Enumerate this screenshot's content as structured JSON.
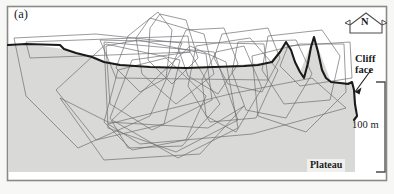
{
  "figure": {
    "panel_letter": "(a)",
    "type": "terrain-cross-section-with-home-range-polygons",
    "annotations": {
      "cliff_face": "Cliff\nface",
      "plateau": "Plateau",
      "scale": "100 m",
      "north": "N"
    },
    "colors": {
      "background": "#f7f7f5",
      "frame": "#8a8a88",
      "terrain_fill": "#d9d9d7",
      "terrain_profile_line": "#1a1a1a",
      "polygon_line": "#6e6e72",
      "label_text": "#1b1b1b",
      "plateau_badge": "#f0f0ee"
    },
    "elements": {
      "frame_visible": true,
      "north_arrow_shape": "pentagon-with-side-points",
      "scale_bar_style": "vertical-bracket-right",
      "cliff_leader_arrow": true
    }
  },
  "chart_data": {
    "type": "line",
    "title": "",
    "xlabel": "",
    "ylabel": "",
    "xlim": [
      0,
      394
    ],
    "ylim": [
      194,
      0
    ],
    "grid": false,
    "legend": "none",
    "scale_reference": {
      "label": "100 m",
      "pixel_span": 90,
      "orientation": "vertical",
      "bracket_top_y": 82,
      "bracket_bottom_y": 172
    },
    "series": [
      {
        "name": "terrain-profile",
        "style": "bold-solid",
        "color": "#1a1a1a",
        "points": [
          [
            8,
            45
          ],
          [
            26,
            44
          ],
          [
            60,
            45
          ],
          [
            64,
            49
          ],
          [
            76,
            53
          ],
          [
            92,
            57
          ],
          [
            104,
            62
          ],
          [
            120,
            65
          ],
          [
            150,
            67
          ],
          [
            186,
            68
          ],
          [
            214,
            67
          ],
          [
            244,
            66
          ],
          [
            258,
            65
          ],
          [
            272,
            62
          ],
          [
            280,
            52
          ],
          [
            286,
            42
          ],
          [
            291,
            50
          ],
          [
            295,
            62
          ],
          [
            300,
            72
          ],
          [
            304,
            78
          ],
          [
            308,
            63
          ],
          [
            311,
            47
          ],
          [
            314,
            37
          ],
          [
            318,
            52
          ],
          [
            322,
            70
          ],
          [
            326,
            78
          ],
          [
            331,
            82
          ],
          [
            340,
            83
          ],
          [
            348,
            84
          ],
          [
            352,
            82
          ],
          [
            354,
            90
          ],
          [
            355,
            104
          ],
          [
            357,
            116
          ],
          [
            354,
            120
          ]
        ]
      },
      {
        "name": "plateau-baseline",
        "style": "fill-boundary",
        "color": "#d9d9d7",
        "points": [
          [
            8,
            45
          ],
          [
            8,
            172
          ],
          [
            355,
            172
          ],
          [
            355,
            104
          ],
          [
            352,
            82
          ],
          [
            331,
            82
          ],
          [
            314,
            37
          ],
          [
            300,
            72
          ],
          [
            286,
            42
          ],
          [
            272,
            62
          ],
          [
            214,
            67
          ],
          [
            150,
            67
          ],
          [
            104,
            62
          ],
          [
            64,
            49
          ],
          [
            26,
            44
          ]
        ]
      },
      {
        "name": "home-range-polygon-01",
        "style": "thin-solid",
        "color": "#6e6e72",
        "closed": true,
        "points": [
          [
            14,
            38
          ],
          [
            96,
            34
          ],
          [
            182,
            43
          ],
          [
            150,
            116
          ],
          [
            78,
            148
          ],
          [
            26,
            96
          ]
        ]
      },
      {
        "name": "home-range-polygon-02",
        "style": "thin-solid",
        "color": "#6e6e72",
        "closed": true,
        "points": [
          [
            104,
            42
          ],
          [
            108,
            128
          ],
          [
            176,
            152
          ],
          [
            238,
            120
          ],
          [
            214,
            52
          ]
        ]
      },
      {
        "name": "home-range-polygon-03",
        "style": "thin-solid",
        "color": "#6e6e72",
        "closed": true,
        "points": [
          [
            128,
            36
          ],
          [
            158,
            12
          ],
          [
            172,
            30
          ],
          [
            166,
            78
          ],
          [
            140,
            92
          ],
          [
            116,
            68
          ]
        ]
      },
      {
        "name": "home-range-polygon-04",
        "style": "thin-solid",
        "color": "#6e6e72",
        "closed": true,
        "points": [
          [
            160,
            14
          ],
          [
            186,
            20
          ],
          [
            198,
            58
          ],
          [
            172,
            84
          ],
          [
            148,
            60
          ],
          [
            150,
            28
          ]
        ]
      },
      {
        "name": "home-range-polygon-05",
        "style": "thin-solid",
        "color": "#6e6e72",
        "closed": true,
        "points": [
          [
            112,
            120
          ],
          [
            190,
            46
          ],
          [
            226,
            62
          ],
          [
            238,
            128
          ],
          [
            178,
            158
          ]
        ]
      },
      {
        "name": "home-range-polygon-06",
        "style": "thin-solid",
        "color": "#6e6e72",
        "closed": true,
        "points": [
          [
            106,
            46
          ],
          [
            138,
            40
          ],
          [
            206,
            54
          ],
          [
            212,
            100
          ],
          [
            152,
            130
          ],
          [
            110,
            104
          ]
        ]
      },
      {
        "name": "home-range-polygon-07",
        "style": "thin-solid",
        "color": "#6e6e72",
        "closed": true,
        "points": [
          [
            186,
            30
          ],
          [
            224,
            28
          ],
          [
            238,
            64
          ],
          [
            218,
            94
          ],
          [
            188,
            76
          ],
          [
            178,
            48
          ]
        ]
      },
      {
        "name": "home-range-polygon-08",
        "style": "thin-solid",
        "color": "#6e6e72",
        "closed": true,
        "points": [
          [
            222,
            34
          ],
          [
            268,
            28
          ],
          [
            280,
            58
          ],
          [
            262,
            92
          ],
          [
            228,
            84
          ],
          [
            214,
            58
          ]
        ]
      },
      {
        "name": "home-range-polygon-09",
        "style": "thin-solid",
        "color": "#6e6e72",
        "closed": true,
        "points": [
          [
            238,
            42
          ],
          [
            296,
            40
          ],
          [
            312,
            74
          ],
          [
            286,
            118
          ],
          [
            246,
            110
          ],
          [
            232,
            72
          ]
        ]
      },
      {
        "name": "home-range-polygon-10",
        "style": "thin-solid",
        "color": "#6e6e72",
        "closed": true,
        "points": [
          [
            252,
            56
          ],
          [
            300,
            44
          ],
          [
            344,
            44
          ],
          [
            346,
            92
          ],
          [
            306,
            132
          ],
          [
            258,
            116
          ]
        ]
      },
      {
        "name": "home-range-polygon-11",
        "style": "thin-solid",
        "color": "#6e6e72",
        "closed": true,
        "points": [
          [
            100,
            40
          ],
          [
            264,
            44
          ],
          [
            268,
            80
          ],
          [
            116,
            78
          ]
        ]
      },
      {
        "name": "home-range-polygon-12",
        "style": "thin-solid",
        "color": "#6e6e72",
        "closed": true,
        "points": [
          [
            104,
            122
          ],
          [
            118,
            70
          ],
          [
            166,
            58
          ],
          [
            206,
            96
          ],
          [
            186,
            140
          ],
          [
            132,
            150
          ]
        ]
      },
      {
        "name": "home-range-polygon-13",
        "style": "thin-solid",
        "color": "#6e6e72",
        "closed": true,
        "points": [
          [
            150,
            18
          ],
          [
            204,
            34
          ],
          [
            214,
            74
          ],
          [
            176,
            104
          ],
          [
            142,
            74
          ],
          [
            136,
            38
          ]
        ]
      },
      {
        "name": "home-range-polygon-14",
        "style": "thin-solid",
        "color": "#6e6e72",
        "closed": true,
        "points": [
          [
            196,
            46
          ],
          [
            250,
            38
          ],
          [
            278,
            70
          ],
          [
            256,
            118
          ],
          [
            210,
            122
          ],
          [
            188,
            86
          ]
        ]
      },
      {
        "name": "home-range-polygon-15",
        "style": "thin-solid",
        "color": "#6e6e72",
        "closed": true,
        "points": [
          [
            56,
            90
          ],
          [
            106,
            44
          ],
          [
            180,
            60
          ],
          [
            164,
            124
          ],
          [
            96,
            140
          ]
        ]
      },
      {
        "name": "home-range-polygon-16",
        "style": "thin-solid",
        "color": "#6e6e72",
        "closed": true,
        "points": [
          [
            268,
            36
          ],
          [
            322,
            30
          ],
          [
            340,
            56
          ],
          [
            330,
            100
          ],
          [
            284,
            104
          ],
          [
            262,
            70
          ]
        ]
      },
      {
        "name": "home-range-polygon-17",
        "style": "thin-solid",
        "color": "#6e6e72",
        "closed": true,
        "points": [
          [
            216,
            52
          ],
          [
            244,
            46
          ],
          [
            262,
            88
          ],
          [
            236,
            132
          ],
          [
            206,
            116
          ],
          [
            202,
            80
          ]
        ]
      },
      {
        "name": "home-range-polygon-18",
        "style": "thin-solid",
        "color": "#6e6e72",
        "closed": true,
        "points": [
          [
            110,
            118
          ],
          [
            132,
            60
          ],
          [
            190,
            52
          ],
          [
            220,
            104
          ],
          [
            182,
            146
          ],
          [
            128,
            148
          ]
        ]
      },
      {
        "name": "home-range-polygon-19",
        "style": "thin-solid",
        "color": "#6e6e72",
        "closed": true,
        "points": [
          [
            26,
            42
          ],
          [
            188,
            36
          ],
          [
            190,
            52
          ],
          [
            30,
            58
          ]
        ]
      },
      {
        "name": "home-range-polygon-20",
        "style": "thin-solid",
        "color": "#6e6e72",
        "closed": true,
        "points": [
          [
            288,
            46
          ],
          [
            350,
            42
          ],
          [
            352,
            78
          ],
          [
            300,
            86
          ],
          [
            280,
            66
          ]
        ]
      },
      {
        "name": "home-range-polygon-21",
        "style": "thin-solid",
        "color": "#6e6e72",
        "closed": true,
        "points": [
          [
            60,
            98
          ],
          [
            108,
            122
          ],
          [
            208,
            128
          ],
          [
            244,
            106
          ],
          [
            200,
            154
          ],
          [
            104,
            160
          ]
        ]
      },
      {
        "name": "home-range-polygon-22",
        "style": "thin-solid",
        "color": "#6e6e72",
        "closed": true,
        "points": [
          [
            108,
            124
          ],
          [
            230,
            94
          ],
          [
            312,
            78
          ],
          [
            346,
            108
          ],
          [
            252,
            134
          ],
          [
            140,
            144
          ]
        ]
      }
    ]
  }
}
